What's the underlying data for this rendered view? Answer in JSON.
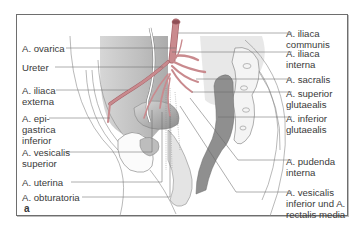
{
  "figure": {
    "panel_letter": "a",
    "colors": {
      "vessel": "#c98a8e",
      "vessel_dark": "#a8646a",
      "organ_gray": "#9e9e9e",
      "organ_light": "#d9d9d9",
      "line": "#6a6a6a"
    },
    "labels_left": [
      {
        "id": "ovarica",
        "text": "A. ovarica"
      },
      {
        "id": "ureter",
        "text": "Ureter"
      },
      {
        "id": "iliaca_externa_1",
        "text": "A. iliaca"
      },
      {
        "id": "iliaca_externa_2",
        "text": "externa"
      },
      {
        "id": "epigastrica_1",
        "text": "A. epi-"
      },
      {
        "id": "epigastrica_2",
        "text": "gastrica"
      },
      {
        "id": "epigastrica_3",
        "text": "inferior"
      },
      {
        "id": "vesicalis_sup_1",
        "text": "A. vesicalis"
      },
      {
        "id": "vesicalis_sup_2",
        "text": "superior"
      },
      {
        "id": "uterina",
        "text": "A. uterina"
      },
      {
        "id": "obturatoria",
        "text": "A. obturatoria"
      }
    ],
    "labels_right": [
      {
        "id": "iliaca_communis_1",
        "text": "A. iliaca"
      },
      {
        "id": "iliaca_communis_2",
        "text": "communis"
      },
      {
        "id": "iliaca_interna_1",
        "text": "A. iliaca"
      },
      {
        "id": "iliaca_interna_2",
        "text": "interna"
      },
      {
        "id": "sacralis",
        "text": "A. sacralis"
      },
      {
        "id": "glut_sup_1",
        "text": "A. superior"
      },
      {
        "id": "glut_sup_2",
        "text": "glutaealis"
      },
      {
        "id": "glut_inf_1",
        "text": "A. inferior"
      },
      {
        "id": "glut_inf_2",
        "text": "glutaealis"
      },
      {
        "id": "pudenda_1",
        "text": "A. pudenda"
      },
      {
        "id": "pudenda_2",
        "text": "interna"
      },
      {
        "id": "vesicalis_inf_1",
        "text": "A. vesicalis"
      },
      {
        "id": "vesicalis_inf_2",
        "text": "inferior und A."
      },
      {
        "id": "vesicalis_inf_3",
        "text": "rectalis media"
      }
    ]
  }
}
